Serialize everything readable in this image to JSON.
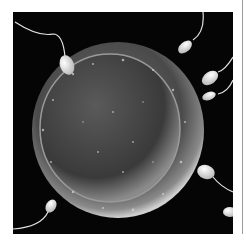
{
  "image": {
    "alt": "Scanning electron micrograph style image of sperm cells approaching an egg cell",
    "subject": "egg-cell-with-sperm",
    "background_color": "#050505",
    "page_background": "#ffffff",
    "sperm_count": 7
  }
}
